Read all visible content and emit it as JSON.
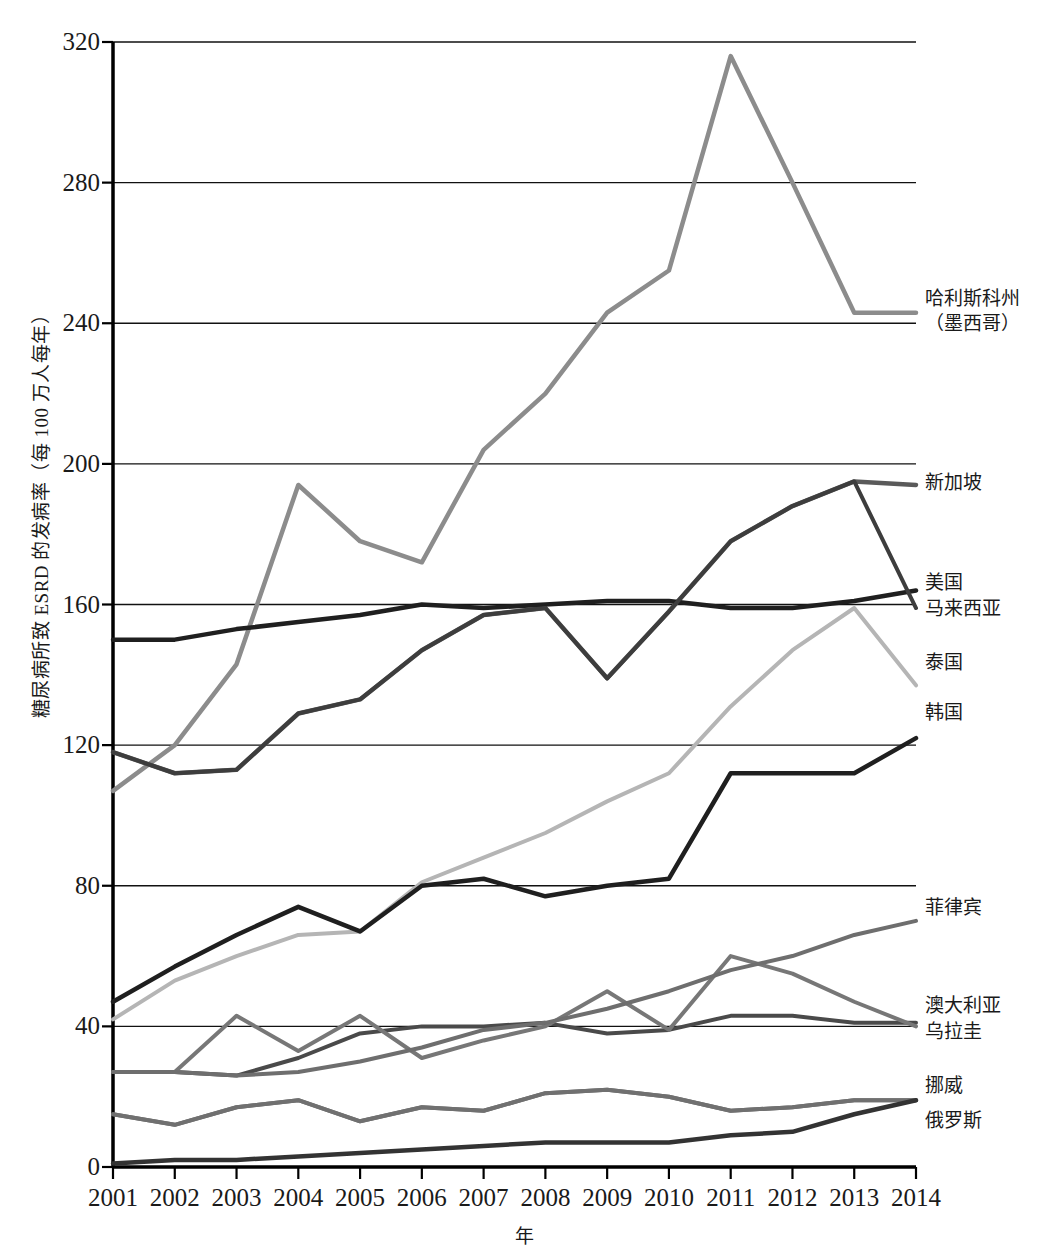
{
  "chart_data": {
    "type": "line",
    "title": "",
    "xlabel": "年",
    "ylabel": "糖尿病所致 ESRD 的发病率（每 100 万人每年）",
    "x": [
      2001,
      2002,
      2003,
      2004,
      2005,
      2006,
      2007,
      2008,
      2009,
      2010,
      2011,
      2012,
      2013,
      2014
    ],
    "xtick_labels": [
      "2001",
      "2002",
      "2003",
      "2004",
      "2005",
      "2006",
      "2007",
      "2008",
      "2009",
      "2010",
      "2011",
      "2012",
      "2013",
      "2014"
    ],
    "ytick_labels": [
      "0",
      "40",
      "80",
      "120",
      "160",
      "200",
      "240",
      "280",
      "320"
    ],
    "yticks": [
      0,
      40,
      80,
      120,
      160,
      200,
      240,
      280,
      320
    ],
    "ylim": [
      0,
      320
    ],
    "xlim": [
      2001,
      2014
    ],
    "grid": true,
    "legend_position": "right-inline",
    "series": [
      {
        "name": "哈利斯科州（墨西哥）",
        "color": "#8c8c8c",
        "width": 4.5,
        "values": [
          107,
          120,
          143,
          194,
          178,
          172,
          204,
          220,
          243,
          255,
          316,
          280,
          243,
          243
        ]
      },
      {
        "name": "新加坡",
        "color": "#5a5a5a",
        "width": 4.5,
        "values": [
          118,
          112,
          113,
          129,
          133,
          147,
          157,
          159,
          139,
          158,
          178,
          188,
          195,
          194
        ]
      },
      {
        "name": "美国",
        "color": "#1f1f1f",
        "width": 4.5,
        "values": [
          150,
          150,
          153,
          155,
          157,
          160,
          159,
          160,
          161,
          161,
          159,
          159,
          161,
          164
        ]
      },
      {
        "name": "马来西亚",
        "color": "#3d3d3d",
        "width": 4.0,
        "values": [
          118,
          112,
          113,
          129,
          133,
          147,
          157,
          159,
          139,
          158,
          178,
          188,
          195,
          159
        ]
      },
      {
        "name": "泰国",
        "color": "#b5b5b5",
        "width": 4.0,
        "values": [
          42,
          53,
          60,
          66,
          67,
          81,
          88,
          95,
          104,
          112,
          131,
          147,
          159,
          137
        ]
      },
      {
        "name": "韩国",
        "color": "#1f1f1f",
        "width": 4.5,
        "values": [
          47,
          57,
          66,
          74,
          67,
          80,
          82,
          77,
          80,
          82,
          112,
          112,
          112,
          122
        ]
      },
      {
        "name": "菲律宾",
        "color": "#6e6e6e",
        "width": 4.0,
        "values": [
          15,
          12,
          17,
          19,
          13,
          17,
          16,
          21,
          22,
          20,
          16,
          17,
          19,
          19
        ]
      },
      {
        "name": "澳大利亚",
        "color": "#4a4a4a",
        "width": 4.0,
        "values": [
          27,
          27,
          26,
          31,
          38,
          40,
          40,
          41,
          38,
          39,
          43,
          43,
          41,
          41
        ]
      },
      {
        "name": "乌拉圭",
        "color": "#777777",
        "width": 4.0,
        "values": [
          27,
          27,
          43,
          33,
          43,
          31,
          36,
          40,
          50,
          39,
          60,
          55,
          47,
          40
        ]
      },
      {
        "name": "挪威",
        "color": "#707070",
        "width": 4.0,
        "values": [
          15,
          12,
          17,
          19,
          13,
          17,
          16,
          21,
          22,
          20,
          16,
          17,
          19,
          19
        ]
      },
      {
        "name": "俄罗斯",
        "color": "#333333",
        "width": 4.5,
        "values": [
          1,
          2,
          2,
          3,
          4,
          5,
          6,
          7,
          7,
          7,
          9,
          10,
          15,
          19
        ]
      },
      {
        "name": "菲律宾-trend",
        "color": "#6e6e6e",
        "width": 4.0,
        "values": [
          27,
          27,
          26,
          27,
          30,
          34,
          39,
          41,
          45,
          50,
          56,
          60,
          66,
          70
        ]
      }
    ],
    "legend_entries": [
      {
        "label": "哈利斯科州",
        "label2": "（墨西哥）",
        "y_value": 243
      },
      {
        "label": "新加坡",
        "label2": "",
        "y_value": 194
      },
      {
        "label": "美国",
        "label2": "",
        "y_value": 164
      },
      {
        "label": "马来西亚",
        "label2": "",
        "y_value": 159
      },
      {
        "label": "泰国",
        "label2": "",
        "y_value": 137
      },
      {
        "label": "韩国",
        "label2": "",
        "y_value": 122
      },
      {
        "label": "菲律宾",
        "label2": "",
        "y_value": 70
      },
      {
        "label": "澳大利亚",
        "label2": "",
        "y_value": 41
      },
      {
        "label": "乌拉圭",
        "label2": "",
        "y_value": 40
      },
      {
        "label": "挪威",
        "label2": "",
        "y_value": 19
      },
      {
        "label": "俄罗斯",
        "label2": "",
        "y_value": 19
      }
    ]
  }
}
